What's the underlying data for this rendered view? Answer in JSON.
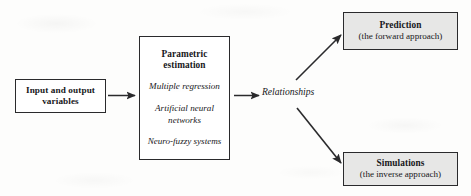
{
  "diagram": {
    "background_color": "#fdfdfc",
    "stroke_color": "#2a2a2c",
    "shaded_fill": "#e7e7e6",
    "white_fill": "#ffffff",
    "nodes": {
      "input": {
        "label_line1": "Input and output",
        "label_line2": "variables",
        "style": "white"
      },
      "parametric": {
        "title_line1": "Parametric",
        "title_line2": "estimation",
        "methods": [
          "Multiple regression",
          "Artificial neural networks",
          "Neuro-fuzzy systems"
        ],
        "style": "white"
      },
      "relationships": {
        "label": "Relationships",
        "style": "plain-italic-text"
      },
      "prediction": {
        "title": "Prediction",
        "subtitle": "(the forward approach)",
        "style": "shaded"
      },
      "simulations": {
        "title": "Simulations",
        "subtitle": "(the inverse approach)",
        "style": "shaded"
      }
    },
    "edges": [
      {
        "name": "input-to-parametric",
        "from": "input",
        "to": "parametric",
        "kind": "straight-arrow"
      },
      {
        "name": "parametric-to-relationships",
        "from": "parametric",
        "to": "relationships",
        "kind": "straight-arrow"
      },
      {
        "name": "relationships-to-prediction",
        "from": "relationships",
        "to": "prediction",
        "kind": "diagonal-arrow-up"
      },
      {
        "name": "relationships-to-simulations",
        "from": "relationships",
        "to": "simulations",
        "kind": "diagonal-arrow-down"
      }
    ]
  }
}
